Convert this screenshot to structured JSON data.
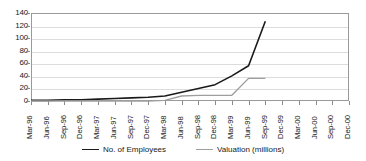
{
  "chart_data": {
    "type": "line",
    "title": "",
    "xlabel": "",
    "ylabel": "",
    "ylim": [
      0,
      140
    ],
    "ytick_step": 20,
    "yticks": [
      "0",
      "20",
      "40",
      "60",
      "80",
      "100",
      "120",
      "140"
    ],
    "grid": true,
    "legend_position": "bottom-center",
    "categories": [
      "Mar-96",
      "Jun-96",
      "Sep-96",
      "Dec-96",
      "Mar-97",
      "Jun-97",
      "Sep-97",
      "Dec-97",
      "Mar-98",
      "Jun-98",
      "Sep-98",
      "Dec-98",
      "Mar-99",
      "Jun-99",
      "Sep-99",
      "Dec-99",
      "Mar-00",
      "Jun-00",
      "Sep-00",
      "Dec-00"
    ],
    "series": [
      {
        "name": "No. of Employees",
        "color": "#1a1a1a",
        "line_width": 1.6,
        "values": [
          1,
          1,
          2,
          2,
          3,
          4,
          5,
          6,
          8,
          14,
          20,
          26,
          40,
          56,
          127,
          null,
          null,
          null,
          null,
          null
        ]
      },
      {
        "name": "Valuation (millions)",
        "color": "#9e9e9e",
        "line_width": 1.4,
        "values": [
          0,
          0,
          0,
          0,
          0,
          0,
          0,
          0,
          1,
          8,
          9,
          9,
          9,
          36,
          36,
          null,
          null,
          null,
          null,
          null
        ]
      }
    ]
  },
  "axis": {
    "frame_color": "#9a9a9a",
    "grid_color": "#dcdcdc",
    "tick_color": "#8c8c8c"
  }
}
